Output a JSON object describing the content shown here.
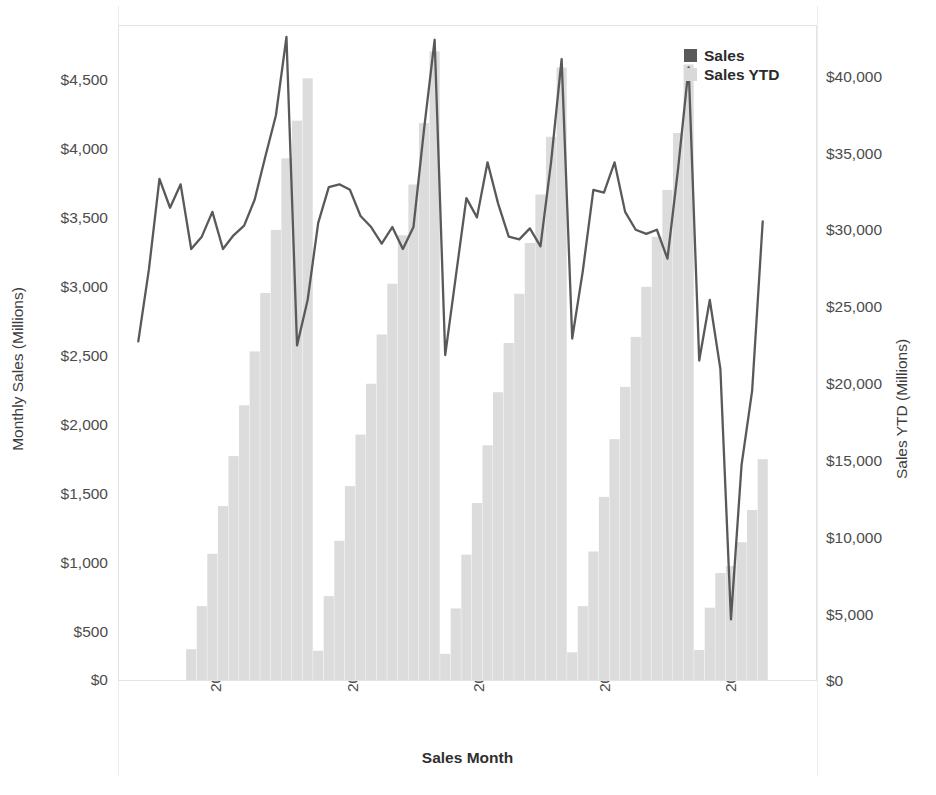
{
  "axes": {
    "left": {
      "title": "Monthly Sales (Millions)",
      "ticks": [
        "$4,500",
        "$4,000",
        "$3,500",
        "$3,000",
        "$2,500",
        "$2,000",
        "$1,500",
        "$1,000",
        "$500",
        "$0"
      ],
      "min": 0,
      "max": 4750
    },
    "right": {
      "title": "Sales YTD (Millions)",
      "ticks": [
        "$40,000",
        "$35,000",
        "$30,000",
        "$25,000",
        "$20,000",
        "$15,000",
        "$10,000",
        "$5,000",
        "$0"
      ],
      "min": 0,
      "max": 42500
    },
    "x": {
      "title": "Sales Month",
      "ticks": [
        "2016",
        "2017",
        "2018",
        "2019",
        "2020"
      ]
    }
  },
  "legend": {
    "position": "top-right",
    "items": [
      {
        "label": "Sales",
        "color": "#595959",
        "type": "line"
      },
      {
        "label": "Sales YTD",
        "color": "#d9d9d9",
        "type": "bar"
      }
    ]
  },
  "colors": {
    "sales_line": "#595959",
    "ytd_bar": "#dcdcdc",
    "frame": "#e3e3e3",
    "text": "#4c4c4c",
    "background": "#ffffff"
  },
  "chart_data": {
    "type": "line",
    "title": "",
    "xlabel": "Sales Month",
    "ylabel": "Monthly Sales (Millions)",
    "y2label": "Sales YTD (Millions)",
    "grid": false,
    "legend_position": "top-right",
    "ylim": [
      0,
      4750
    ],
    "y2lim": [
      0,
      42500
    ],
    "x": [
      "2015-08",
      "2015-09",
      "2015-10",
      "2015-11",
      "2015-12",
      "2016-01",
      "2016-02",
      "2016-03",
      "2016-04",
      "2016-05",
      "2016-06",
      "2016-07",
      "2016-08",
      "2016-09",
      "2016-10",
      "2016-11",
      "2016-12",
      "2017-01",
      "2017-02",
      "2017-03",
      "2017-04",
      "2017-05",
      "2017-06",
      "2017-07",
      "2017-08",
      "2017-09",
      "2017-10",
      "2017-11",
      "2017-12",
      "2018-01",
      "2018-02",
      "2018-03",
      "2018-04",
      "2018-05",
      "2018-06",
      "2018-07",
      "2018-08",
      "2018-09",
      "2018-10",
      "2018-11",
      "2018-12",
      "2019-01",
      "2019-02",
      "2019-03",
      "2019-04",
      "2019-05",
      "2019-06",
      "2019-07",
      "2019-08",
      "2019-09",
      "2019-10",
      "2019-11",
      "2019-12",
      "2020-01",
      "2020-02",
      "2020-03",
      "2020-04",
      "2020-05",
      "2020-06",
      "2020-07"
    ],
    "series": [
      {
        "name": "Sales",
        "axis": "left",
        "type": "line",
        "color": "#595959",
        "values": [
          2460,
          2980,
          3640,
          3430,
          3600,
          3130,
          3220,
          3400,
          3130,
          3230,
          3300,
          3490,
          3800,
          4100,
          4670,
          2430,
          2760,
          3320,
          3580,
          3600,
          3560,
          3370,
          3290,
          3170,
          3290,
          3130,
          3290,
          4000,
          4650,
          2360,
          2930,
          3500,
          3360,
          3760,
          3460,
          3220,
          3200,
          3280,
          3150,
          3760,
          4510,
          2480,
          2970,
          3560,
          3540,
          3760,
          3400,
          3270,
          3240,
          3270,
          3060,
          3710,
          4450,
          2320,
          2760,
          2260,
          440,
          1560,
          2100,
          3330
        ]
      },
      {
        "name": "Sales YTD",
        "axis": "right",
        "type": "bar",
        "color": "#dcdcdc",
        "values": [
          null,
          null,
          null,
          null,
          null,
          2000,
          4800,
          8200,
          11300,
          14550,
          17850,
          21350,
          25150,
          29250,
          33900,
          36350,
          39100,
          1900,
          5450,
          9050,
          12600,
          15950,
          19250,
          22450,
          25750,
          28900,
          32200,
          36200,
          40850,
          1700,
          4650,
          8150,
          11500,
          15250,
          18700,
          21900,
          25100,
          28400,
          31550,
          35300,
          39800,
          1800,
          4800,
          8350,
          11900,
          15650,
          19050,
          22300,
          25550,
          28800,
          31850,
          35550,
          40000,
          1950,
          4700,
          6950,
          7400,
          8950,
          11050,
          14350
        ]
      }
    ]
  }
}
